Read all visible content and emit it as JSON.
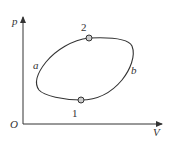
{
  "diagram": {
    "type": "pV cycle diagram",
    "axes": {
      "y_label": "p",
      "x_label": "V",
      "origin_label": "O"
    },
    "points": [
      {
        "id": "1",
        "label": "1"
      },
      {
        "id": "2",
        "label": "2"
      }
    ],
    "paths": [
      {
        "id": "a",
        "label": "a"
      },
      {
        "id": "b",
        "label": "b"
      }
    ],
    "colors": {
      "line": "#333333",
      "point_fill": "#cccccc"
    }
  }
}
